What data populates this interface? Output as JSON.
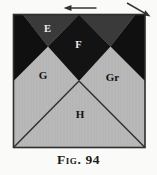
{
  "figure": {
    "caption": "Fig. 94",
    "regions": {
      "e": "E",
      "f": "F",
      "g": "G",
      "gr": "Gr",
      "h": "H"
    },
    "icons": {
      "left_arrow": "left-arrow",
      "diagonal_arrow": "down-right-arrow"
    },
    "colors": {
      "paper": "#fafaf8",
      "panel_fill": "#b9b9b9",
      "dark_gray_triangle": "#3a3a3a",
      "black_region": "#131313",
      "outline": "#2e2e2e",
      "light_label": "#efefef",
      "dark_label": "#111111"
    }
  }
}
